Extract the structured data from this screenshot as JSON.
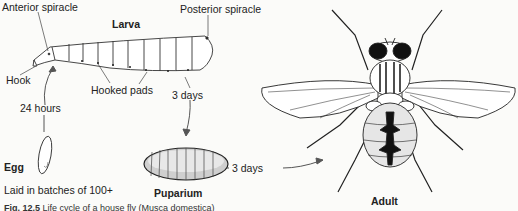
{
  "diagram": {
    "title": "Life cycle of a house fly",
    "stages": {
      "larva": {
        "label": "Larva",
        "parts": [
          "Anterior spiracle",
          "Posterior spiracle",
          "Hook",
          "Hooked pads"
        ]
      },
      "egg": {
        "label": "Egg",
        "note": "Laid in batches of 100+"
      },
      "puparium": {
        "label": "Puparium"
      },
      "adult": {
        "label": "Adult"
      }
    },
    "transitions": {
      "egg_to_larva": "24 hours",
      "larva_to_puparium": "3 days",
      "puparium_to_adult": "3 days"
    },
    "caption": {
      "figure": "Fig. 12.5",
      "text": "Life cycle of a house fly (Musca domestica)"
    }
  }
}
